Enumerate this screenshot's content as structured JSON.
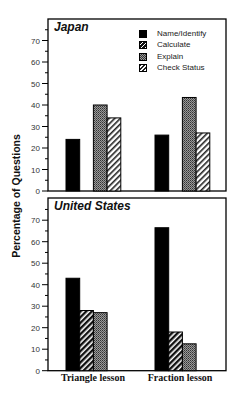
{
  "chart_data": [
    {
      "type": "bar",
      "title": "Japan",
      "categories": [
        "Triangle lesson",
        "Fraction lesson"
      ],
      "series": [
        {
          "name": "Name/Identify",
          "values": [
            24,
            26
          ]
        },
        {
          "name": "Calculate",
          "values": [
            0,
            0
          ]
        },
        {
          "name": "Explain",
          "values": [
            40,
            43.5
          ]
        },
        {
          "name": "Check Status",
          "values": [
            34,
            27
          ]
        }
      ],
      "xlabel": "",
      "ylabel": "Percentage of Questions",
      "ylim": [
        0,
        75
      ],
      "yticks": [
        0,
        10,
        20,
        30,
        40,
        50,
        60,
        70
      ],
      "grid": false,
      "legend_position": "upper right"
    },
    {
      "type": "bar",
      "title": "United States",
      "categories": [
        "Triangle lesson",
        "Fraction lesson"
      ],
      "series": [
        {
          "name": "Name/Identify",
          "values": [
            43,
            66.5
          ]
        },
        {
          "name": "Calculate",
          "values": [
            28,
            18
          ]
        },
        {
          "name": "Explain",
          "values": [
            27,
            12.5
          ]
        },
        {
          "name": "Check Status",
          "values": [
            0,
            0
          ]
        }
      ],
      "xlabel": "",
      "ylabel": "Percentage of Questions",
      "ylim": [
        0,
        75
      ],
      "yticks": [
        0,
        10,
        20,
        30,
        40,
        50,
        60,
        70
      ],
      "grid": false
    }
  ],
  "labels": {
    "ylabel": "Percentage of Questions",
    "japan_title": "Japan",
    "us_title": "United States",
    "x_triangle": "Triangle lesson",
    "x_fraction": "Fraction lesson"
  },
  "legend": [
    {
      "name": "Name/Identify",
      "pattern": "solid"
    },
    {
      "name": "Calculate",
      "pattern": "hatch-dark"
    },
    {
      "name": "Explain",
      "pattern": "dots"
    },
    {
      "name": "Check Status",
      "pattern": "hatch-light"
    }
  ],
  "colors": {
    "solid": "#000000",
    "dots_bg": "#8a8a8a",
    "hatch_dark_bg": "#444444",
    "hatch_light_bg": "#ffffff",
    "axis": "#000000"
  }
}
